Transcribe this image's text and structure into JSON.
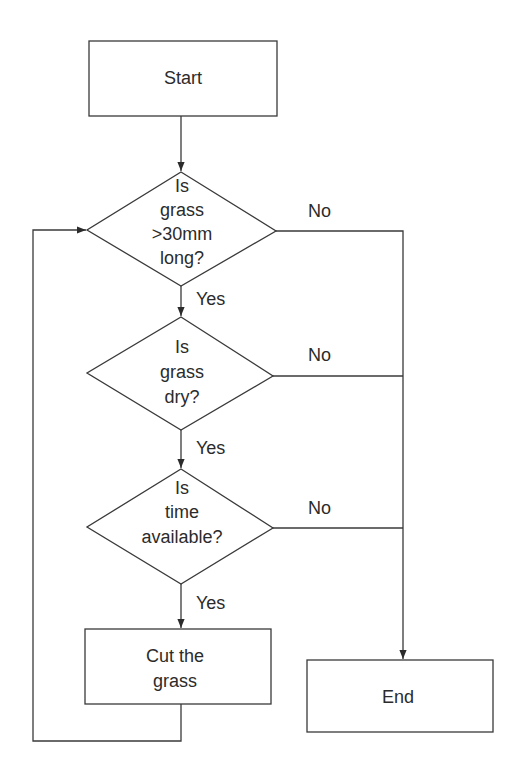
{
  "diagram": {
    "type": "flowchart",
    "nodes": [
      {
        "id": "start",
        "shape": "rect",
        "lines": [
          "Start"
        ]
      },
      {
        "id": "q_long",
        "shape": "diamond",
        "lines": [
          "Is",
          "grass",
          ">30mm",
          "long?"
        ]
      },
      {
        "id": "q_dry",
        "shape": "diamond",
        "lines": [
          "Is",
          "grass",
          "dry?"
        ]
      },
      {
        "id": "q_time",
        "shape": "diamond",
        "lines": [
          "Is",
          "time",
          "available?"
        ]
      },
      {
        "id": "cut",
        "shape": "rect",
        "lines": [
          "Cut the",
          "grass"
        ]
      },
      {
        "id": "end",
        "shape": "rect",
        "lines": [
          "End"
        ]
      }
    ],
    "edges": [
      {
        "from": "start",
        "to": "q_long",
        "label": ""
      },
      {
        "from": "q_long",
        "to": "q_dry",
        "label": "Yes"
      },
      {
        "from": "q_long",
        "to": "end",
        "label": "No"
      },
      {
        "from": "q_dry",
        "to": "q_time",
        "label": "Yes"
      },
      {
        "from": "q_dry",
        "to": "end",
        "label": "No"
      },
      {
        "from": "q_time",
        "to": "cut",
        "label": "Yes"
      },
      {
        "from": "q_time",
        "to": "end",
        "label": "No"
      },
      {
        "from": "cut",
        "to": "q_long",
        "label": ""
      }
    ]
  }
}
